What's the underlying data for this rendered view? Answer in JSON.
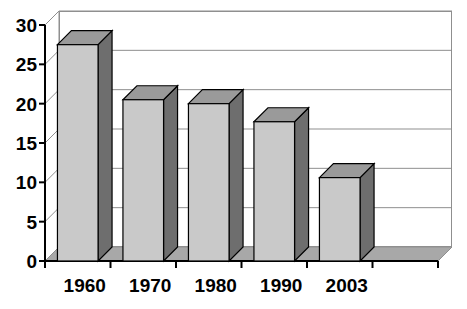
{
  "chart_data": {
    "type": "bar",
    "title": "",
    "subtitle": "",
    "xlabel": "",
    "ylabel": "",
    "categories": [
      "1960",
      "1970",
      "1980",
      "1990",
      "2003"
    ],
    "values": [
      27.5,
      20.5,
      20.0,
      17.7,
      10.6
    ],
    "series": [
      {
        "name": "",
        "values": [
          27.5,
          20.5,
          20.0,
          17.7,
          10.6
        ]
      }
    ],
    "ylim": [
      0,
      30
    ],
    "ytick_labels": [
      "0",
      "5",
      "10",
      "15",
      "20",
      "25",
      "30"
    ],
    "ytick_values": [
      0,
      5,
      10,
      15,
      20,
      25,
      30
    ],
    "grid": true,
    "legend": null,
    "legend_position": "none",
    "style": "3d-column",
    "empty_category_slots": 1,
    "colors": {
      "bar_front": "#c9c9c9",
      "bar_side": "#6e6e6e",
      "bar_top": "#9a9a9a",
      "bar_outline": "#000000",
      "floor_top": "#a8a8a8",
      "floor_front": "#bdbdbd",
      "gridline": "#8f8f8f",
      "axis": "#000000",
      "background": "#ffffff",
      "text": "#000000"
    }
  },
  "axis": {
    "y_ticks": [
      {
        "label": "30",
        "value": 30
      },
      {
        "label": "25",
        "value": 25
      },
      {
        "label": "20",
        "value": 20
      },
      {
        "label": "15",
        "value": 15
      },
      {
        "label": "10",
        "value": 10
      },
      {
        "label": "5",
        "value": 5
      },
      {
        "label": "0",
        "value": 0
      }
    ],
    "x_ticks": [
      {
        "label": "1960"
      },
      {
        "label": "1970"
      },
      {
        "label": "1980"
      },
      {
        "label": "1990"
      },
      {
        "label": "2003"
      }
    ]
  }
}
